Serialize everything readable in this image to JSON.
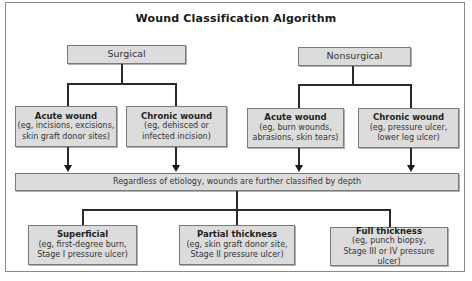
{
  "diagram": {
    "title": "Wound Classification Algorithm",
    "categories": [
      {
        "label": "Surgical",
        "children": [
          {
            "heading": "Acute wound",
            "line1": "(eg, incisions, excisions,",
            "line2": "skin graft donor sites)"
          },
          {
            "heading": "Chronic wound",
            "line1": "(eg, dehisced or",
            "line2": "infected incision)"
          }
        ]
      },
      {
        "label": "Nonsurgical",
        "children": [
          {
            "heading": "Acute wound",
            "line1": "(eg, burn wounds,",
            "line2": "abrasions, skin tears)"
          },
          {
            "heading": "Chronic wound",
            "line1": "(eg, pressure ulcer,",
            "line2": "lower leg ulcer)"
          }
        ]
      }
    ],
    "depth_note": "Regardless of etiology, wounds are further classified by depth",
    "depths": [
      {
        "heading": "Superficial",
        "line1": "(eg, first-degree burn,",
        "line2": "Stage I pressure ulcer)"
      },
      {
        "heading": "Partial thickness",
        "line1": "(eg, skin graft donor site,",
        "line2": "Stage II pressure ulcer)"
      },
      {
        "heading": "Full thickness",
        "line1": "(eg, punch biopsy,",
        "line2": "Stage III or IV pressure ulcer)"
      }
    ],
    "colors": {
      "box_fill": "#dcdcdc",
      "box_border": "#7a7a7a",
      "line": "#2a2a2a"
    }
  }
}
